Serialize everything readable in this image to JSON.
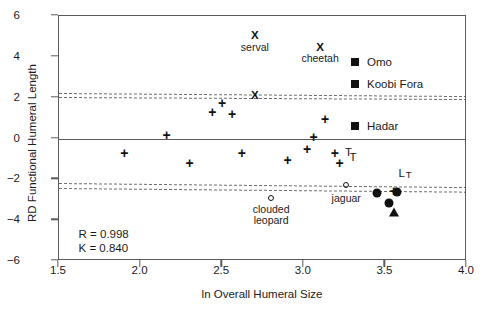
{
  "chart_data": {
    "type": "scatter",
    "title": "",
    "xlabel": "ln Overall Humeral Size",
    "ylabel": "RD Functional Humeral Length",
    "xlim": [
      1.5,
      4.0
    ],
    "ylim": [
      -6,
      6
    ],
    "xticks": [
      "1.5",
      "2.0",
      "2.5",
      "3.0",
      "3.5",
      "4.0"
    ],
    "xtick_values": [
      1.5,
      2.0,
      2.5,
      3.0,
      3.5,
      4.0
    ],
    "yticks": [
      "6",
      "4",
      "2",
      "0",
      "−2",
      "−4",
      "−6"
    ],
    "ytick_values": [
      6,
      4,
      2,
      0,
      -2,
      -4,
      -6
    ],
    "grid": false,
    "legend_position": "upper-right-inside",
    "regression_line": {
      "y": 0,
      "label": "RD = 0 reference / regression line"
    },
    "confidence_bands": [
      {
        "name": "upper-outer",
        "y_left": 2.25,
        "y_right": 2.1
      },
      {
        "name": "upper-inner",
        "y_left": 2.05,
        "y_right": 1.95
      },
      {
        "name": "lower-outer",
        "y_left": -2.2,
        "y_right": -2.4
      },
      {
        "name": "lower-inner",
        "y_left": -2.4,
        "y_right": -2.58
      }
    ],
    "series": [
      {
        "name": "extant felids",
        "marker": "plus",
        "points": [
          {
            "x": 1.9,
            "y": -0.7
          },
          {
            "x": 2.16,
            "y": 0.15
          },
          {
            "x": 2.3,
            "y": -1.2
          },
          {
            "x": 2.44,
            "y": 1.3
          },
          {
            "x": 2.56,
            "y": 1.22
          },
          {
            "x": 2.5,
            "y": 1.75
          },
          {
            "x": 2.62,
            "y": -0.7
          },
          {
            "x": 2.9,
            "y": -1.05
          },
          {
            "x": 3.02,
            "y": -0.5
          },
          {
            "x": 3.06,
            "y": 0.05
          },
          {
            "x": 3.13,
            "y": 0.95
          },
          {
            "x": 3.19,
            "y": -0.7
          },
          {
            "x": 3.22,
            "y": -1.2
          },
          {
            "x": 3.55,
            "y": -2.55
          }
        ]
      },
      {
        "name": "named felids (X)",
        "marker": "x-bold",
        "points": [
          {
            "x": 2.7,
            "y": 5.0,
            "label": "serval"
          },
          {
            "x": 3.1,
            "y": 4.45,
            "label": "cheetah"
          },
          {
            "x": 2.7,
            "y": 2.1,
            "label": ""
          }
        ]
      },
      {
        "name": "named felids (open circle)",
        "marker": "circle-open",
        "points": [
          {
            "x": 2.8,
            "y": -2.9,
            "label": "clouded leopard"
          },
          {
            "x": 3.26,
            "y": -2.3,
            "label": "jaguar"
          }
        ]
      },
      {
        "name": "fossil specimens (filled circle)",
        "marker": "circle-filled",
        "points": [
          {
            "x": 3.45,
            "y": -2.65
          },
          {
            "x": 3.52,
            "y": -3.15
          },
          {
            "x": 3.57,
            "y": -2.62
          }
        ]
      },
      {
        "name": "fossil specimen (triangle)",
        "marker": "triangle-filled",
        "points": [
          {
            "x": 3.55,
            "y": -3.6
          }
        ]
      }
    ],
    "point_labels": [
      {
        "text": "serval",
        "x": 2.7,
        "y": 4.45
      },
      {
        "text": "cheetah",
        "x": 3.1,
        "y": 3.9
      },
      {
        "text": "clouded\nleopard",
        "x": 2.8,
        "y": -3.5
      },
      {
        "text": "jaguar",
        "x": 3.26,
        "y": -2.95
      }
    ],
    "annotations": [
      {
        "text": "T",
        "x": 3.28,
        "y": -0.95
      },
      {
        "text": "L",
        "sub": "T",
        "x": 3.58,
        "y": -1.75
      }
    ],
    "legend": [
      {
        "label": "Omo",
        "marker": "square-filled",
        "color": "#111111"
      },
      {
        "label": "Koobi Fora",
        "marker": "square-filled",
        "color": "#111111"
      },
      {
        "label": "Hadar",
        "marker": "square-filled",
        "color": "#111111"
      },
      {
        "label": "T",
        "marker": "none",
        "color": "#111111"
      }
    ],
    "stats": {
      "r_label": "R = 0.998",
      "k_label": "K = 0.840"
    },
    "colors": {
      "axis": "#5b5b5b",
      "marker": "#111111",
      "band": "#6e6e6e",
      "text": "#1a1a1a",
      "background": "#ffffff"
    }
  }
}
